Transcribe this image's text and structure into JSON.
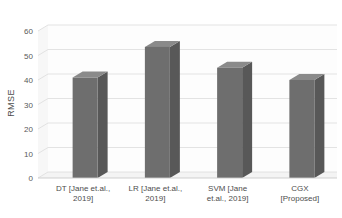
{
  "chart_data": {
    "type": "bar",
    "title": "",
    "subtitle": "",
    "xlabel": "",
    "ylabel": "RMSE",
    "categories": [
      "DT [Jane et.al., 2019]",
      "LR [Jane et.al., 2019]",
      "SVM [Jane et.al., 2019]",
      "CGX [Proposed]"
    ],
    "category_lines": [
      [
        "DT [Jane et.al.,",
        "2019]"
      ],
      [
        "LR [Jane et.al.,",
        "2019]"
      ],
      [
        "SVM [Jane",
        "et.al., 2019]"
      ],
      [
        "CGX",
        "[Proposed]"
      ]
    ],
    "values": [
      41,
      53.5,
      45,
      40
    ],
    "ylim": [
      0,
      60
    ],
    "yticks": [
      0,
      10,
      20,
      30,
      40,
      50,
      60
    ],
    "ytick_labels": [
      "0",
      "10",
      "20",
      "30",
      "40",
      "50",
      "60"
    ],
    "grid": true,
    "legend": false,
    "legend_position": "none",
    "style": "3d-column",
    "series": [
      {
        "name": "RMSE",
        "values": [
          41,
          53.5,
          45,
          40
        ]
      }
    ]
  },
  "colors": {
    "bar_front": "#6e6e6e",
    "bar_side": "#585858",
    "bar_top": "#8a8a8a",
    "gridline": "#d9d9d9",
    "floor": "#f2f2f2",
    "wall": "#fbfbfb",
    "tick_text": "#595959",
    "label_text": "#4d4d4d",
    "background": "#ffffff"
  }
}
